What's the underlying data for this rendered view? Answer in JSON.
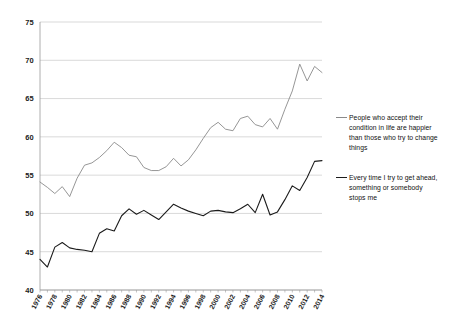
{
  "chart_data": {
    "type": "line",
    "title": "",
    "subtitle": "",
    "xlabel": "",
    "ylabel": "",
    "xlim": [
      1976,
      2014
    ],
    "ylim": [
      40,
      75
    ],
    "ytick_step": 5,
    "xtick_step": 2,
    "grid": true,
    "legend_position": "right",
    "yticks": [
      "75",
      "70",
      "65",
      "60",
      "55",
      "50",
      "45",
      "40"
    ],
    "xticks": [
      "1976",
      "1978",
      "1980",
      "1982",
      "1984",
      "1986",
      "1988",
      "1990",
      "1992",
      "1994",
      "1996",
      "1998",
      "2000",
      "2002",
      "2004",
      "2006",
      "2008",
      "2010",
      "2012",
      "2014"
    ],
    "x": [
      1976,
      1977,
      1978,
      1979,
      1980,
      1981,
      1982,
      1983,
      1984,
      1985,
      1986,
      1987,
      1988,
      1989,
      1990,
      1991,
      1992,
      1993,
      1994,
      1995,
      1996,
      1997,
      1998,
      1999,
      2000,
      2001,
      2002,
      2003,
      2004,
      2005,
      2006,
      2007,
      2008,
      2009,
      2010,
      2011,
      2012,
      2013,
      2014
    ],
    "series": [
      {
        "name": "People who accept their condition in life are happier than those who try to change things",
        "color": "#8a8a8a",
        "values": [
          54.1,
          53.4,
          52.6,
          53.5,
          52.2,
          54.6,
          56.3,
          56.6,
          57.3,
          58.2,
          59.3,
          58.6,
          57.6,
          57.4,
          56.0,
          55.6,
          55.6,
          56.1,
          57.2,
          56.2,
          57.0,
          58.3,
          59.8,
          61.2,
          61.9,
          61.0,
          60.8,
          62.4,
          62.7,
          61.6,
          61.3,
          62.4,
          61.0,
          63.6,
          66.0,
          69.5,
          67.3,
          69.2,
          68.4
        ]
      },
      {
        "name": "Every time I try to get ahead, something or somebody stops me",
        "color": "#1b1b1b",
        "values": [
          44.0,
          43.0,
          45.6,
          46.2,
          45.5,
          45.3,
          45.2,
          45.0,
          47.4,
          48.0,
          47.7,
          49.7,
          50.6,
          49.9,
          50.4,
          49.8,
          49.2,
          50.2,
          51.2,
          50.7,
          50.3,
          50.0,
          49.7,
          50.3,
          50.4,
          50.2,
          50.1,
          50.6,
          51.2,
          50.1,
          52.5,
          49.8,
          50.2,
          51.8,
          53.6,
          53.0,
          54.7,
          56.8,
          56.9
        ]
      }
    ]
  },
  "legend": {
    "items": [
      {
        "id": "accept",
        "label": "People who accept their condition in life are happier than those who try to change things",
        "color": "#8a8a8a"
      },
      {
        "id": "stops",
        "label": "Every time I try to get ahead, something or somebody stops me",
        "color": "#1b1b1b"
      }
    ]
  },
  "colors": {
    "grid": "#c8c8c8",
    "axis": "#9a9a9a",
    "text": "#1b1b1b",
    "background": "#ffffff"
  }
}
